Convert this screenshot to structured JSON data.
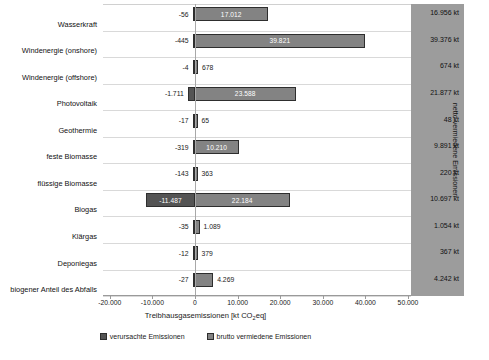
{
  "chart_data": {
    "type": "bar",
    "orientation": "horizontal",
    "title": "",
    "xlabel": "Treibhausgasemissionen [kt CO2eq]",
    "ylabel": "",
    "xlim": [
      -20000,
      50000
    ],
    "xticks": [
      -20000,
      -10000,
      0,
      10000,
      20000,
      30000,
      40000,
      50000
    ],
    "xticklabels": [
      "-20.000",
      "-10.000",
      "0",
      "10.000",
      "20.000",
      "30.000",
      "40.000",
      "50.000"
    ],
    "grid": true,
    "legend_position": "bottom",
    "categories": [
      "Wasserkraft",
      "Windenergie (onshore)",
      "Windenergie (offshore)",
      "Photovoltaik",
      "Geothermie",
      "feste Biomasse",
      "flüssige Biomasse",
      "Biogas",
      "Klärgas",
      "Deponiegas",
      "biogener Anteil des Abfalls"
    ],
    "series": [
      {
        "name": "verursachte Emissionen",
        "color": "#545454",
        "values": [
          -56,
          -445,
          -4,
          -1711,
          -17,
          -319,
          -143,
          -11487,
          -35,
          -12,
          -27
        ],
        "labels": [
          "-56",
          "-445",
          "-4",
          "-1.711",
          "-17",
          "-319",
          "-143",
          "-11.487",
          "-35",
          "-12",
          "-27"
        ]
      },
      {
        "name": "brutto vermiedene Emissionen",
        "color": "#838383",
        "values": [
          17012,
          39821,
          678,
          23588,
          65,
          10210,
          363,
          22184,
          1089,
          379,
          4269
        ],
        "labels": [
          "17.012",
          "39.821",
          "678",
          "23.588",
          "65",
          "10.210",
          "363",
          "22.184",
          "1.089",
          "379",
          "4.269"
        ]
      }
    ],
    "net_column": {
      "title": "netto vermiedene Emissionen",
      "values": [
        "16.956 kt",
        "39.376 kt",
        "674 kt",
        "21.877 kt",
        "48 kt",
        "9.891 kt",
        "220 kt",
        "10.697 kt",
        "1.054 kt",
        "367 kt",
        "4.242 kt"
      ]
    }
  },
  "legend": {
    "items": [
      {
        "label": "verursachte Emissionen"
      },
      {
        "label": "brutto vermiedene Emissionen"
      }
    ]
  },
  "axis": {
    "title_main": "Treibhausgasemissionen [kt CO",
    "title_sub": "2",
    "title_end": "eq]"
  }
}
